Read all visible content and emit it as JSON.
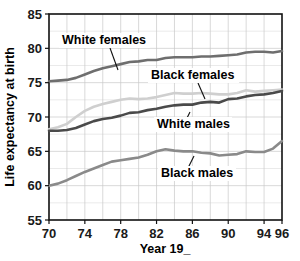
{
  "chart_data": {
    "type": "line",
    "title": "",
    "xlabel": "Year 19_",
    "ylabel": "Life expectancy at birth",
    "xlim": [
      70,
      96
    ],
    "ylim": [
      55,
      85
    ],
    "grid": true,
    "legend_position": "inline-annotations",
    "x_ticks": [
      70,
      74,
      78,
      82,
      86,
      90,
      94,
      96
    ],
    "x_tick_labels": [
      "70",
      "74",
      "78",
      "82",
      "86",
      "90",
      "94",
      "96"
    ],
    "y_ticks": [
      55,
      60,
      65,
      70,
      75,
      80,
      85
    ],
    "y_tick_labels": [
      "55",
      "60",
      "65",
      "70",
      "75",
      "80",
      "85"
    ],
    "y_minor_step": 2.5,
    "x_minor_step": 2,
    "x": [
      70,
      71,
      72,
      73,
      74,
      75,
      76,
      77,
      78,
      79,
      80,
      81,
      82,
      83,
      84,
      85,
      86,
      87,
      88,
      89,
      90,
      91,
      92,
      93,
      94,
      95,
      96
    ],
    "series": [
      {
        "name": "White females",
        "color": "#6e6e6e",
        "width": 2.6,
        "values": [
          75.2,
          75.3,
          75.4,
          75.7,
          76.2,
          76.7,
          77.1,
          77.4,
          77.7,
          78.0,
          78.1,
          78.3,
          78.3,
          78.6,
          78.7,
          78.7,
          78.7,
          78.8,
          78.8,
          78.9,
          79.0,
          79.1,
          79.4,
          79.5,
          79.5,
          79.4,
          79.6
        ]
      },
      {
        "name": "Black females",
        "color": "#cfcfcf",
        "width": 2.6,
        "values": [
          68.2,
          68.5,
          69.0,
          70.0,
          70.9,
          71.5,
          71.9,
          72.2,
          72.5,
          72.7,
          72.6,
          72.7,
          72.9,
          73.2,
          73.5,
          73.4,
          73.4,
          73.5,
          73.4,
          73.3,
          73.3,
          73.5,
          73.9,
          73.7,
          73.8,
          73.9,
          74.0
        ]
      },
      {
        "name": "White males",
        "color": "#4a4a4a",
        "width": 2.6,
        "values": [
          68.0,
          68.0,
          68.1,
          68.4,
          68.9,
          69.4,
          69.7,
          69.9,
          70.2,
          70.6,
          70.7,
          71.0,
          71.2,
          71.5,
          71.7,
          71.8,
          71.8,
          72.1,
          72.2,
          72.1,
          72.6,
          72.7,
          73.0,
          73.2,
          73.3,
          73.5,
          73.8
        ]
      },
      {
        "name": "Black males",
        "color": "#8a8a8a",
        "width": 2.6,
        "values": [
          60.0,
          60.3,
          60.8,
          61.4,
          62.0,
          62.5,
          63.0,
          63.5,
          63.7,
          63.9,
          64.1,
          64.5,
          65.0,
          65.3,
          65.1,
          65.0,
          65.0,
          64.8,
          64.7,
          64.4,
          64.5,
          64.6,
          65.0,
          64.9,
          64.9,
          65.4,
          66.5
        ]
      }
    ],
    "annotations": [
      {
        "label": "White females",
        "text_x": 62,
        "text_y": 44,
        "leader": [
          [
            110,
            48
          ],
          [
            118,
            70
          ]
        ]
      },
      {
        "label": "Black females",
        "text_x": 151,
        "text_y": 79,
        "leader": [
          [
            198,
            83
          ],
          [
            205,
            99
          ]
        ]
      },
      {
        "label": "White males",
        "text_x": 157,
        "text_y": 128,
        "leader": [
          [
            190,
            112
          ],
          [
            184,
            124
          ]
        ]
      },
      {
        "label": "Black males",
        "text_x": 161,
        "text_y": 177,
        "leader": [
          [
            194,
            156
          ],
          [
            186,
            172
          ]
        ]
      }
    ]
  }
}
